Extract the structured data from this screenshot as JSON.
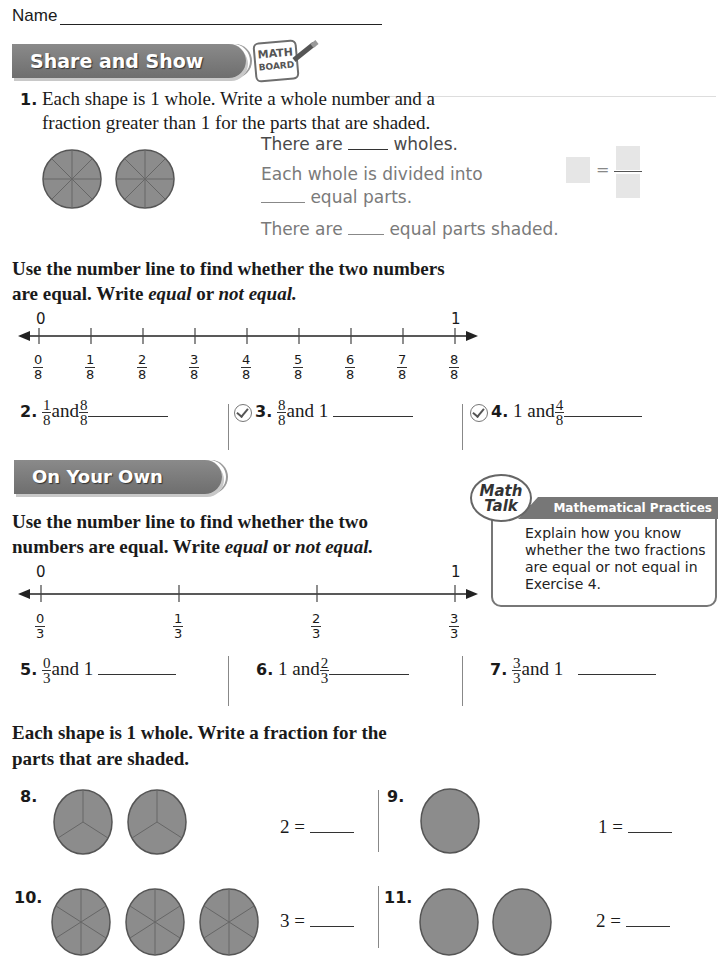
{
  "header": {
    "name_label": "Name"
  },
  "share_and_show": {
    "banner": "Share and Show",
    "mathboard_line1": "MATH",
    "mathboard_line2": "BOARD"
  },
  "q1": {
    "number": "1.",
    "text_line1": "Each shape is 1 whole. Write a whole number and a",
    "text_line2": "fraction greater than 1 for the parts that are shaded.",
    "line_a_pre": "There are",
    "line_a_post": "wholes.",
    "line_b1": "Each whole is divided into",
    "line_b2_post": "equal parts.",
    "line_c_pre": "There are",
    "line_c_post": "equal parts shaded.",
    "equals": "=",
    "shapes": [
      {
        "parts": 8,
        "shaded": 8
      },
      {
        "parts": 8,
        "shaded": 8
      }
    ]
  },
  "section_a": {
    "instr_line1": "Use the number line to find whether the two numbers",
    "instr_line2_pre": "are equal. Write ",
    "instr_equal": "equal",
    "instr_or": " or ",
    "instr_not_equal": "not equal."
  },
  "number_line_eighths": {
    "start_label": "0",
    "end_label": "1",
    "ticks": [
      {
        "n": "0",
        "d": "8"
      },
      {
        "n": "1",
        "d": "8"
      },
      {
        "n": "2",
        "d": "8"
      },
      {
        "n": "3",
        "d": "8"
      },
      {
        "n": "4",
        "d": "8"
      },
      {
        "n": "5",
        "d": "8"
      },
      {
        "n": "6",
        "d": "8"
      },
      {
        "n": "7",
        "d": "8"
      },
      {
        "n": "8",
        "d": "8"
      }
    ]
  },
  "exercises_a": [
    {
      "number": "2.",
      "a_n": "1",
      "a_d": "8",
      "and": "and",
      "b_n": "8",
      "b_d": "8",
      "checked": false
    },
    {
      "number": "3.",
      "a_n": "8",
      "a_d": "8",
      "and": "and 1",
      "checked": true
    },
    {
      "number": "4.",
      "pre": "1 and",
      "b_n": "4",
      "b_d": "8",
      "checked": true
    }
  ],
  "on_your_own": {
    "banner": "On Your Own",
    "instr_line1": "Use the number line to find whether the two",
    "instr_line2_pre": "numbers are equal. Write ",
    "instr_equal": "equal",
    "instr_or": " or ",
    "instr_not_equal": "not equal."
  },
  "math_talk": {
    "bubble_line1": "Math",
    "bubble_line2": "Talk",
    "header": "Mathematical Practices",
    "text": "Explain how you know whether the two fractions are equal or not equal in Exercise 4."
  },
  "number_line_thirds": {
    "start_label": "0",
    "end_label": "1",
    "ticks": [
      {
        "n": "0",
        "d": "3"
      },
      {
        "n": "1",
        "d": "3"
      },
      {
        "n": "2",
        "d": "3"
      },
      {
        "n": "3",
        "d": "3"
      }
    ]
  },
  "exercises_b": [
    {
      "number": "5.",
      "a_n": "0",
      "a_d": "3",
      "post": "and 1"
    },
    {
      "number": "6.",
      "pre": "1 and",
      "b_n": "2",
      "b_d": "3"
    },
    {
      "number": "7.",
      "a_n": "3",
      "a_d": "3",
      "post": "and 1"
    }
  ],
  "section_c": {
    "instr_line1": "Each shape is 1 whole. Write a fraction for the",
    "instr_line2": "parts that are shaded."
  },
  "exercises_c": [
    {
      "number": "8.",
      "equation": "2 =",
      "shapes": 2,
      "parts": 3
    },
    {
      "number": "9.",
      "equation": "1 =",
      "shapes": 1,
      "parts": 1
    },
    {
      "number": "10.",
      "equation": "3 =",
      "shapes": 3,
      "parts": 6
    },
    {
      "number": "11.",
      "equation": "2 =",
      "shapes": 2,
      "parts": 1
    }
  ],
  "colors": {
    "shape_fill": "#8c8c8c",
    "shape_stroke": "#555555",
    "banner": "#7a7a7a"
  }
}
